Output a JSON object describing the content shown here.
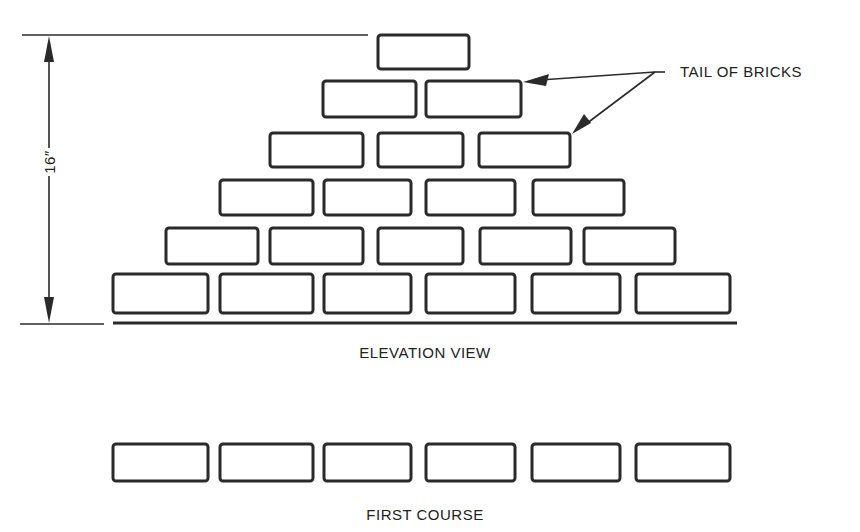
{
  "dimension": {
    "label": "16″"
  },
  "callout": {
    "label": "TAIL OF BRICKS"
  },
  "elevation": {
    "caption": "ELEVATION VIEW",
    "courses": [
      {
        "name": "course-1",
        "y": 274,
        "h": 39,
        "bricks": [
          [
            113,
            95
          ],
          [
            220,
            93
          ],
          [
            324,
            87
          ],
          [
            426,
            89
          ],
          [
            532,
            88
          ],
          [
            636,
            94
          ]
        ]
      },
      {
        "name": "course-2",
        "y": 228,
        "h": 36,
        "bricks": [
          [
            166,
            92
          ],
          [
            270,
            93
          ],
          [
            378,
            85
          ],
          [
            480,
            91
          ],
          [
            584,
            91
          ]
        ]
      },
      {
        "name": "course-3",
        "y": 180,
        "h": 35,
        "bricks": [
          [
            220,
            93
          ],
          [
            324,
            87
          ],
          [
            426,
            89
          ],
          [
            533,
            91
          ]
        ]
      },
      {
        "name": "course-4",
        "y": 133,
        "h": 34,
        "bricks": [
          [
            270,
            93
          ],
          [
            378,
            85
          ],
          [
            479,
            91
          ]
        ]
      },
      {
        "name": "course-5",
        "y": 81,
        "h": 36,
        "bricks": [
          [
            323,
            93
          ],
          [
            426,
            95
          ]
        ]
      },
      {
        "name": "course-6",
        "y": 35,
        "h": 34,
        "bricks": [
          [
            378,
            91
          ]
        ]
      }
    ]
  },
  "first_course": {
    "caption": "FIRST COURSE",
    "y": 444,
    "h": 37,
    "bricks": [
      [
        113,
        95
      ],
      [
        220,
        93
      ],
      [
        324,
        87
      ],
      [
        426,
        89
      ],
      [
        532,
        88
      ],
      [
        636,
        94
      ]
    ]
  },
  "colors": {
    "ink": "#2a2a2a",
    "background": "#ffffff"
  }
}
